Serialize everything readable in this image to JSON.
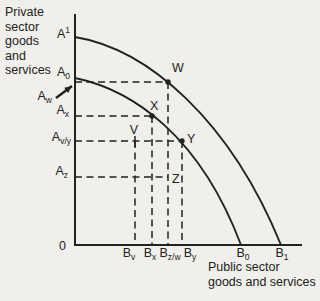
{
  "colors": {
    "background": "#f0efeb",
    "ink": "#232220"
  },
  "titles": {
    "y_axis": "Private\nsector\ngoods\nand\nservices",
    "x_axis": "Public sector\ngoods and services"
  },
  "origin_label": "0",
  "geometry": {
    "axis": {
      "x0": 75,
      "y0": 245,
      "x_end": 302,
      "y_top": 14
    },
    "curves": [
      {
        "name": "outer-ppf-curve",
        "path": [
          [
            75,
            37
          ],
          [
            148,
            49
          ],
          [
            230,
            120
          ],
          [
            281,
            245
          ]
        ]
      },
      {
        "name": "inner-ppf-curve",
        "path": [
          [
            75,
            78
          ],
          [
            133,
            90
          ],
          [
            200,
            136
          ],
          [
            241,
            245
          ]
        ]
      }
    ],
    "h_guides": [
      {
        "to": "W",
        "y": 82,
        "x_to": 168
      },
      {
        "to": "X",
        "y": 116,
        "x_to": 152
      },
      {
        "to": "Y",
        "y": 141,
        "x_to": 182
      },
      {
        "to": "Z",
        "y": 177,
        "x_to": 168
      }
    ],
    "v_guides": [
      {
        "from": "V",
        "x": 135,
        "y_from": 141
      },
      {
        "from": "X",
        "x": 152,
        "y_from": 116
      },
      {
        "from": "W",
        "x": 168,
        "y_from": 82
      },
      {
        "from": "Y",
        "x": 182,
        "y_from": 141
      }
    ],
    "points": [
      {
        "label": "W",
        "x": 168,
        "y": 82,
        "marker": "dot",
        "ldx": 4,
        "ldy": -10,
        "anchor": "start"
      },
      {
        "label": "X",
        "x": 152,
        "y": 116,
        "marker": "dot",
        "ldx": -2,
        "ldy": -6,
        "anchor": "start"
      },
      {
        "label": "V",
        "x": 135,
        "y": 141,
        "marker": "tick",
        "ldx": -1,
        "ldy": -7,
        "anchor": "middle"
      },
      {
        "label": "Y",
        "x": 182,
        "y": 141,
        "marker": "dot",
        "ldx": 5,
        "ldy": 2,
        "anchor": "start"
      },
      {
        "label": "Z",
        "x": 168,
        "y": 177,
        "marker": "none",
        "ldx": 4,
        "ldy": 6,
        "anchor": "start"
      }
    ],
    "y_labels": [
      {
        "main": "A",
        "script": "1",
        "script_type": "sup",
        "label_x": 70,
        "label_y": 38
      },
      {
        "main": "A",
        "script": "0",
        "script_type": "sub",
        "label_x": 70,
        "label_y": 76
      },
      {
        "main": "A",
        "script": "w",
        "script_type": "sub",
        "label_x": 52,
        "label_y": 100,
        "arrow_from": [
          56,
          98
        ],
        "arrow_to": [
          72,
          86
        ]
      },
      {
        "main": "A",
        "script": "x",
        "script_type": "sub",
        "label_x": 69,
        "label_y": 114
      },
      {
        "main": "A",
        "script": "v/y",
        "script_type": "sub",
        "label_x": 71,
        "label_y": 141
      },
      {
        "main": "A",
        "script": "z",
        "script_type": "sub",
        "label_x": 68,
        "label_y": 175
      }
    ],
    "x_label_baseline": 257,
    "x_labels": [
      {
        "main": "B",
        "script": "v",
        "label_x": 129
      },
      {
        "main": "B",
        "script": "x",
        "label_x": 150
      },
      {
        "main": "B",
        "script": "z/w",
        "label_x": 170
      },
      {
        "main": "B",
        "script": "y",
        "label_x": 190
      },
      {
        "main": "B",
        "script": "0",
        "label_x": 243
      },
      {
        "main": "B",
        "script": "1",
        "label_x": 282
      }
    ]
  }
}
